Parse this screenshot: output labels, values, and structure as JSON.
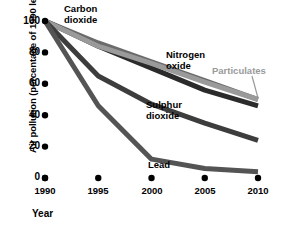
{
  "chart_data": {
    "type": "line",
    "title": "",
    "xlabel": "Year",
    "ylabel": "Air pollution (percentage of 1990 level)",
    "x": [
      1990,
      1995,
      2000,
      2005,
      2010
    ],
    "xticklabels": [
      "1990",
      "1995",
      "2000",
      "2005",
      "2010"
    ],
    "yticklabels": [
      "0",
      "20",
      "40",
      "60",
      "80",
      "100"
    ],
    "yticks": [
      0,
      20,
      40,
      60,
      80,
      100
    ],
    "ylim": [
      0,
      100
    ],
    "xlim": [
      1990,
      2010
    ],
    "grid": false,
    "legend": "inline-annotations",
    "series": [
      {
        "name": "Carbon dioxide",
        "color": "#6b6b6b",
        "values": [
          100,
          86,
          74,
          62,
          50
        ],
        "label_x": 64,
        "label_y": 4
      },
      {
        "name": "Nitrogen oxide",
        "color": "#2b2b2b",
        "values": [
          100,
          84,
          70,
          56,
          46
        ],
        "label_x": 166,
        "label_y": 50
      },
      {
        "name": "Particulates",
        "color": "#9a9a9a",
        "values": [
          100,
          84,
          73,
          61,
          50
        ],
        "label_x": 212,
        "label_y": 66
      },
      {
        "name": "Sulphur dioxide",
        "color": "#3d3d3d",
        "values": [
          100,
          65,
          47,
          35,
          24
        ],
        "label_x": 146,
        "label_y": 100
      },
      {
        "name": "Lead",
        "color": "#545454",
        "values": [
          100,
          46,
          12,
          6,
          4
        ],
        "label_x": 148,
        "label_y": 160
      }
    ]
  },
  "axis": {
    "y_title": "Air pollution (percentage of 1990 level)",
    "x_title": "Year",
    "y_tick_labels": [
      "100",
      "80",
      "60",
      "40",
      "20",
      "0"
    ],
    "x_tick_labels": [
      "1990",
      "1995",
      "2000",
      "2005",
      "2010"
    ]
  },
  "labels": {
    "carbon_dioxide": "Carbon\ndioxide",
    "nitrogen_oxide": "Nitrogen\noxide",
    "particulates": "Particulates",
    "sulphur_dioxide": "Sulphur\ndioxide",
    "lead": "Lead"
  }
}
